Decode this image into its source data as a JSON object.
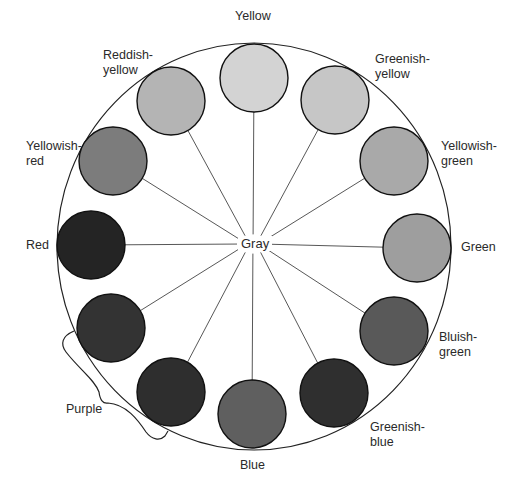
{
  "diagram": {
    "center_label": "Gray",
    "center": {
      "x": 253,
      "y": 244
    },
    "outer_ellipse": {
      "cx": 254,
      "cy": 246.5,
      "rx": 197,
      "ry": 203.5
    },
    "swatch_radius": 34,
    "swatches": [
      {
        "id": "yellow",
        "label_lines": [
          "Yellow"
        ],
        "cx": 254,
        "cy": 78,
        "fill": "#d3d3d3",
        "label_x": 235,
        "label_y": 9
      },
      {
        "id": "greenish-yellow",
        "label_lines": [
          "Greenish-",
          "yellow"
        ],
        "cx": 335,
        "cy": 100,
        "fill": "#c6c6c6",
        "label_x": 375,
        "label_y": 52
      },
      {
        "id": "yellowish-green",
        "label_lines": [
          "Yellowish-",
          "green"
        ],
        "cx": 394,
        "cy": 161,
        "fill": "#a9a9a9",
        "label_x": 441,
        "label_y": 139
      },
      {
        "id": "green",
        "label_lines": [
          "Green"
        ],
        "cx": 417,
        "cy": 248,
        "fill": "#9e9e9e",
        "label_x": 461,
        "label_y": 240
      },
      {
        "id": "bluish-green",
        "label_lines": [
          "Bluish-",
          "green"
        ],
        "cx": 394,
        "cy": 331,
        "fill": "#595959",
        "label_x": 439,
        "label_y": 330
      },
      {
        "id": "greenish-blue",
        "label_lines": [
          "Greenish-",
          "blue"
        ],
        "cx": 334,
        "cy": 393,
        "fill": "#2f2f2f",
        "label_x": 370,
        "label_y": 420
      },
      {
        "id": "blue",
        "label_lines": [
          "Blue"
        ],
        "cx": 252,
        "cy": 414,
        "fill": "#5f5f5f",
        "label_x": 240,
        "label_y": 458
      },
      {
        "id": "purple-2",
        "label_lines": [],
        "cx": 171,
        "cy": 392,
        "fill": "#2e2e2e",
        "label_x": 0,
        "label_y": 0
      },
      {
        "id": "purple-1",
        "label_lines": [],
        "cx": 111,
        "cy": 328,
        "fill": "#333333",
        "label_x": 0,
        "label_y": 0
      },
      {
        "id": "red",
        "label_lines": [
          "Red"
        ],
        "cx": 91,
        "cy": 245,
        "fill": "#242424",
        "label_x": 26,
        "label_y": 238
      },
      {
        "id": "yellowish-red",
        "label_lines": [
          "Yellowish-",
          "red"
        ],
        "cx": 113,
        "cy": 161,
        "fill": "#7c7c7c",
        "label_x": 26,
        "label_y": 139
      },
      {
        "id": "reddish-yellow",
        "label_lines": [
          "Reddish-",
          "yellow"
        ],
        "cx": 171,
        "cy": 101,
        "fill": "#b4b4b4",
        "label_x": 103,
        "label_y": 48
      }
    ],
    "group_labels": [
      {
        "id": "purple",
        "text": "Purple",
        "x": 66,
        "y": 402
      }
    ]
  }
}
